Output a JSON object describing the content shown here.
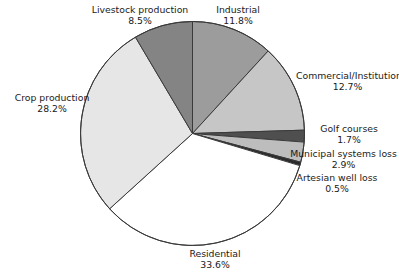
{
  "chart_data": {
    "type": "pie",
    "title": "",
    "subtitle": "",
    "xlabel": "",
    "ylabel": "",
    "legend_position": "none",
    "grid": false,
    "start_angle_deg": -90,
    "direction": "clockwise",
    "units": "percent",
    "categories": [
      "Industrial",
      "Commercial/Institutional",
      "Golf courses",
      "Municipal systems loss",
      "Artesian well loss",
      "Residential",
      "Crop production",
      "Livestock production"
    ],
    "values": [
      11.8,
      12.7,
      1.7,
      2.9,
      0.5,
      33.6,
      28.2,
      8.5
    ],
    "slice_colors": [
      "#9c9c9c",
      "#c6c6c6",
      "#4f4f4f",
      "#bdbdbd",
      "#2b2b2b",
      "#ffffff",
      "#e6e6e6",
      "#848484"
    ],
    "slices": [
      {
        "label": "Industrial",
        "value": 11.8,
        "value_text": "11.8%",
        "color": "#9c9c9c"
      },
      {
        "label": "Commercial/Institutional",
        "value": 12.7,
        "value_text": "12.7%",
        "color": "#c6c6c6"
      },
      {
        "label": "Golf courses",
        "value": 1.7,
        "value_text": "1.7%",
        "color": "#4f4f4f"
      },
      {
        "label": "Municipal systems loss",
        "value": 2.9,
        "value_text": "2.9%",
        "color": "#bdbdbd"
      },
      {
        "label": "Artesian well loss",
        "value": 0.5,
        "value_text": "0.5%",
        "color": "#2b2b2b"
      },
      {
        "label": "Residential",
        "value": 33.6,
        "value_text": "33.6%",
        "color": "#ffffff"
      },
      {
        "label": "Crop production",
        "value": 28.2,
        "value_text": "28.2%",
        "color": "#e6e6e6"
      },
      {
        "label": "Livestock production",
        "value": 8.5,
        "value_text": "8.5%",
        "color": "#848484"
      }
    ]
  },
  "labels": {
    "livestock": {
      "name": "Livestock production",
      "pct": "8.5%"
    },
    "industrial": {
      "name": "Industrial",
      "pct": "11.8%"
    },
    "commercial": {
      "name": "Commercial/Institutional",
      "pct": "12.7%"
    },
    "golf": {
      "name": "Golf courses",
      "pct": "1.7%"
    },
    "municipal": {
      "name": "Municipal systems loss",
      "pct": "2.9%"
    },
    "artesian": {
      "name": "Artesian well loss",
      "pct": "0.5%"
    },
    "residential": {
      "name": "Residential",
      "pct": "33.6%"
    },
    "crop": {
      "name": "Crop production",
      "pct": "28.2%"
    }
  },
  "style": {
    "outline_color": "#3a3a3a",
    "background": "#ffffff"
  }
}
